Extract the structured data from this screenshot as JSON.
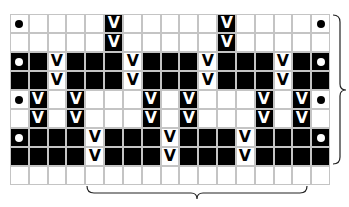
{
  "grid": {
    "columns": 17,
    "rows": 9,
    "legend": {
      "W": "white (empty) cell",
      "B": "black cell",
      "Vb": "black cell with V symbol",
      "Vw": "white cell with V symbol",
      "Dw": "white cell with dot",
      "Db": "black cell with dot"
    },
    "cells": [
      [
        "Dw",
        "W",
        "W",
        "W",
        "W",
        "Vb",
        "W",
        "W",
        "W",
        "W",
        "W",
        "Vb",
        "W",
        "W",
        "W",
        "W",
        "Dw"
      ],
      [
        "W",
        "W",
        "W",
        "W",
        "W",
        "Vb",
        "W",
        "W",
        "W",
        "W",
        "W",
        "Vb",
        "W",
        "W",
        "W",
        "W",
        "W"
      ],
      [
        "Db",
        "B",
        "Vw",
        "B",
        "B",
        "B",
        "Vw",
        "B",
        "B",
        "B",
        "Vw",
        "B",
        "B",
        "B",
        "Vw",
        "B",
        "Db"
      ],
      [
        "B",
        "B",
        "Vw",
        "B",
        "B",
        "B",
        "Vw",
        "B",
        "B",
        "B",
        "Vw",
        "B",
        "B",
        "B",
        "Vw",
        "B",
        "B"
      ],
      [
        "Dw",
        "Vb",
        "W",
        "Vb",
        "W",
        "W",
        "W",
        "Vb",
        "W",
        "Vb",
        "W",
        "W",
        "W",
        "Vb",
        "W",
        "Vb",
        "Dw"
      ],
      [
        "W",
        "Vb",
        "W",
        "Vb",
        "W",
        "W",
        "W",
        "Vb",
        "W",
        "Vb",
        "W",
        "W",
        "W",
        "Vb",
        "W",
        "Vb",
        "W"
      ],
      [
        "Db",
        "B",
        "B",
        "B",
        "Vw",
        "B",
        "B",
        "B",
        "Vw",
        "B",
        "B",
        "B",
        "Vw",
        "B",
        "B",
        "B",
        "Db"
      ],
      [
        "B",
        "B",
        "B",
        "B",
        "Vw",
        "B",
        "B",
        "B",
        "Vw",
        "B",
        "B",
        "B",
        "Vw",
        "B",
        "B",
        "B",
        "B"
      ],
      [
        "W",
        "W",
        "W",
        "W",
        "W",
        "W",
        "W",
        "W",
        "W",
        "W",
        "W",
        "W",
        "W",
        "W",
        "W",
        "W",
        "W"
      ]
    ],
    "symbols": {
      "v": "V"
    },
    "colors": {
      "grid_line": "#c4c4c4",
      "dark": "#000000",
      "light": "#ffffff"
    }
  },
  "braces": {
    "right": {
      "description": "repeat brace spanning rows 1-8",
      "from_row": 1,
      "to_row": 8
    },
    "bottom": {
      "description": "repeat brace spanning columns 5-16",
      "from_col": 5,
      "to_col": 16
    }
  }
}
